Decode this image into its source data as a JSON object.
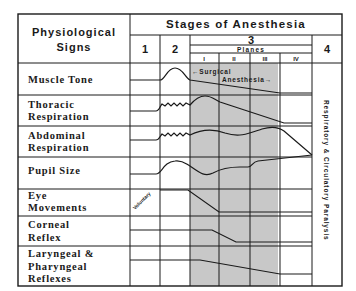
{
  "header": {
    "signs_line1": "Physiological",
    "signs_line2": "Signs",
    "stages_title": "Stages of Anesthesia",
    "stage1": "1",
    "stage2": "2",
    "stage3": "3",
    "stage4": "4",
    "planes": "Planes",
    "plane_labels": [
      "I",
      "II",
      "III",
      "IV"
    ]
  },
  "rows": [
    {
      "label": [
        "Muscle Tone"
      ]
    },
    {
      "label": [
        "Thoracic",
        "Respiration"
      ]
    },
    {
      "label": [
        "Abdominal",
        "Respiration"
      ]
    },
    {
      "label": [
        "Pupil Size"
      ]
    },
    {
      "label": [
        "Eye",
        "Movements"
      ]
    },
    {
      "label": [
        "Corneal",
        "Reflex"
      ]
    },
    {
      "label": [
        "Laryngeal &",
        "Pharyngeal",
        "Reflexes"
      ]
    }
  ],
  "annotations": {
    "surgical": "←Surgical",
    "anesthesia": "Anesthesia→",
    "voluntary": "Voluntary",
    "stage4_vertical": "Respiratory & Circulatory Paralysis"
  },
  "colors": {
    "line": "#1a1a1a",
    "shade": "#c8c8c8"
  }
}
